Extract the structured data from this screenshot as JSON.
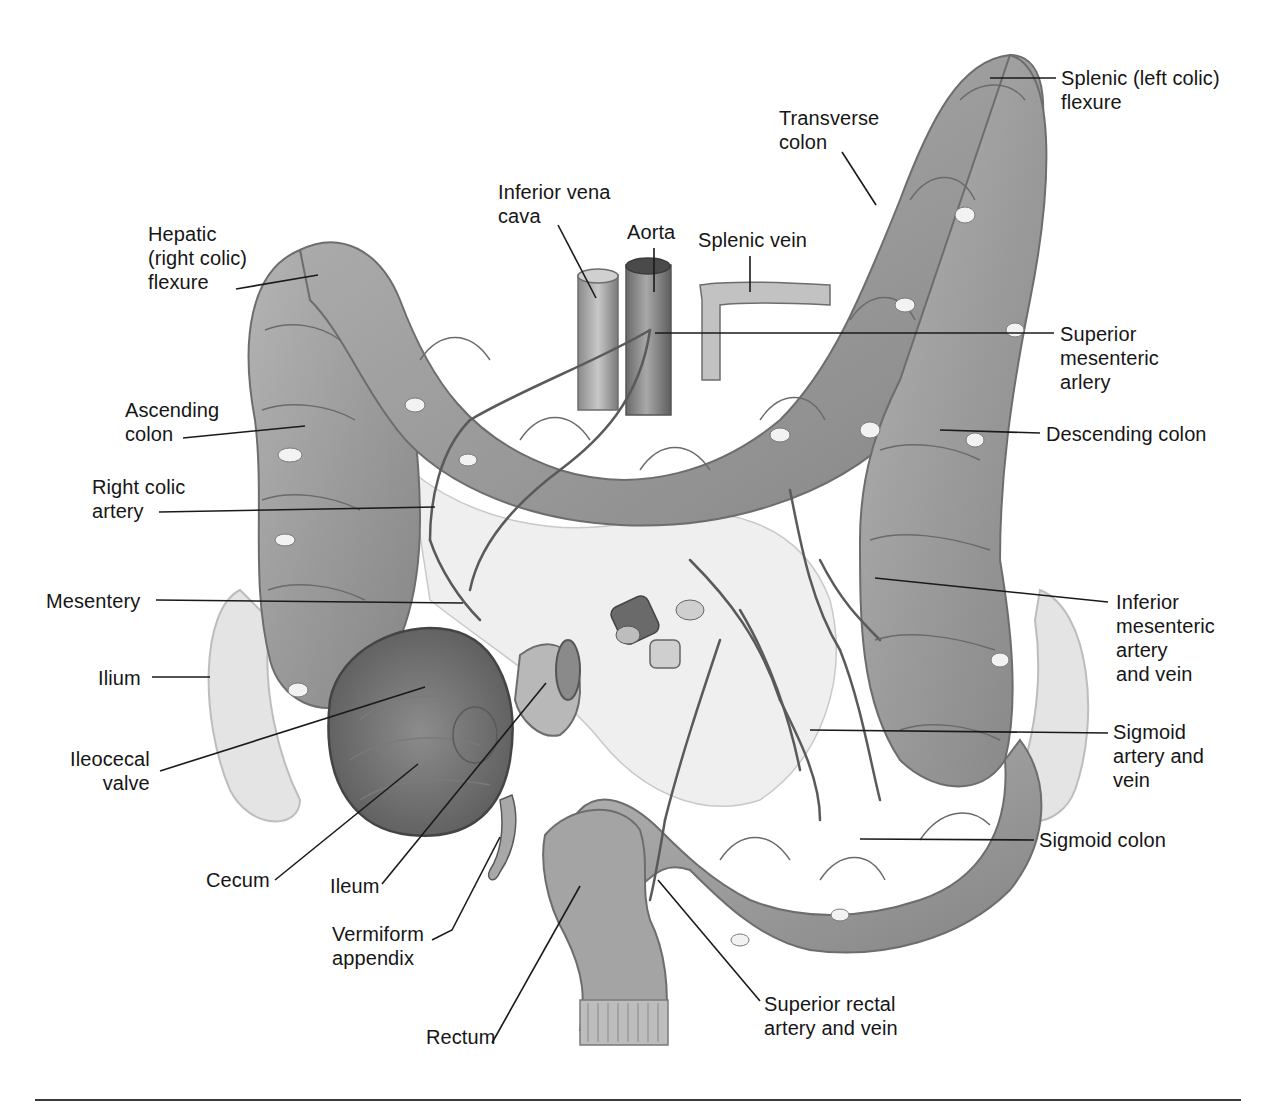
{
  "figure": {
    "colors": {
      "background": "#ffffff",
      "organ_fill": "#9a9a9a",
      "organ_light": "#c4c4c4",
      "organ_dark": "#6e6e6e",
      "vessel": "#5a5a5a",
      "leader_line": "#1a1a1a",
      "label_text": "#161616",
      "ilium_fill": "#e6e6e6"
    },
    "labels": [
      {
        "id": "splenic-flexure",
        "text": "Splenic (left colic)\nflexure",
        "x": 1061,
        "y": 66,
        "align": "left",
        "line": [
          [
            1056,
            78
          ],
          [
            990,
            78
          ]
        ]
      },
      {
        "id": "transverse-colon",
        "text": "Transverse\ncolon",
        "x": 779,
        "y": 106,
        "align": "left",
        "line": [
          [
            842,
            152
          ],
          [
            876,
            205
          ]
        ]
      },
      {
        "id": "inferior-vena-cava",
        "text": "Inferior vena\ncava",
        "x": 498,
        "y": 180,
        "align": "left",
        "line": [
          [
            558,
            225
          ],
          [
            596,
            298
          ]
        ]
      },
      {
        "id": "aorta",
        "text": "Aorta",
        "x": 627,
        "y": 220,
        "align": "left",
        "line": [
          [
            654,
            248
          ],
          [
            654,
            292
          ]
        ]
      },
      {
        "id": "splenic-vein",
        "text": "Splenic vein",
        "x": 698,
        "y": 228,
        "align": "left",
        "line": [
          [
            750,
            256
          ],
          [
            750,
            292
          ]
        ]
      },
      {
        "id": "hepatic-flexure",
        "text": "Hepatic\n(right colic)\nflexure",
        "x": 148,
        "y": 222,
        "align": "left",
        "line": [
          [
            236,
            289
          ],
          [
            318,
            275
          ]
        ]
      },
      {
        "id": "superior-mesenteric-artery",
        "text": "Superior\nmesenteric\narlery",
        "x": 1060,
        "y": 322,
        "align": "left",
        "line": [
          [
            1054,
            333
          ],
          [
            655,
            333
          ]
        ]
      },
      {
        "id": "ascending-colon",
        "text": "Ascending\ncolon",
        "x": 125,
        "y": 398,
        "align": "left",
        "line": [
          [
            183,
            438
          ],
          [
            305,
            426
          ]
        ]
      },
      {
        "id": "descending-colon",
        "text": "Descending colon",
        "x": 1046,
        "y": 422,
        "align": "left",
        "line": [
          [
            1040,
            433
          ],
          [
            940,
            430
          ]
        ]
      },
      {
        "id": "right-colic-artery",
        "text": "Right colic\nartery",
        "x": 92,
        "y": 475,
        "align": "left",
        "line": [
          [
            159,
            512
          ],
          [
            435,
            507
          ]
        ]
      },
      {
        "id": "mesentery",
        "text": "Mesentery",
        "x": 46,
        "y": 589,
        "align": "left",
        "line": [
          [
            156,
            600
          ],
          [
            463,
            603
          ]
        ]
      },
      {
        "id": "inferior-mesenteric",
        "text": "Inferior\nmesenteric\nartery\nand vein",
        "x": 1116,
        "y": 590,
        "align": "left",
        "line": [
          [
            1108,
            602
          ],
          [
            875,
            578
          ]
        ]
      },
      {
        "id": "ilium",
        "text": "Ilium",
        "x": 98,
        "y": 666,
        "align": "left",
        "line": [
          [
            152,
            677
          ],
          [
            210,
            677
          ]
        ]
      },
      {
        "id": "ileocecal-valve",
        "text": "Ileocecal\nvalve",
        "x": 70,
        "y": 747,
        "align": "right",
        "line": [
          [
            160,
            771
          ],
          [
            425,
            687
          ]
        ]
      },
      {
        "id": "sigmoid-artery-vein",
        "text": "Sigmoid\nartery and\nvein",
        "x": 1113,
        "y": 720,
        "align": "left",
        "line": [
          [
            1108,
            733
          ],
          [
            810,
            730
          ]
        ]
      },
      {
        "id": "sigmoid-colon",
        "text": "Sigmoid colon",
        "x": 1039,
        "y": 828,
        "align": "left",
        "line": [
          [
            1034,
            840
          ],
          [
            860,
            839
          ]
        ]
      },
      {
        "id": "cecum",
        "text": "Cecum",
        "x": 206,
        "y": 868,
        "align": "left",
        "line": [
          [
            275,
            880
          ],
          [
            418,
            764
          ]
        ]
      },
      {
        "id": "ileum",
        "text": "Ileum",
        "x": 330,
        "y": 874,
        "align": "left",
        "line": [
          [
            382,
            884
          ],
          [
            546,
            683
          ]
        ]
      },
      {
        "id": "vermiform-appendix",
        "text": "Vermiform\nappendix",
        "x": 332,
        "y": 922,
        "align": "left",
        "line": [
          [
            432,
            940
          ],
          [
            452,
            930
          ],
          [
            500,
            837
          ]
        ]
      },
      {
        "id": "rectum",
        "text": "Rectum",
        "x": 426,
        "y": 1025,
        "align": "left",
        "line": [
          [
            492,
            1043
          ],
          [
            580,
            886
          ]
        ]
      },
      {
        "id": "superior-rectal",
        "text": "Superior rectal\nartery and vein",
        "x": 764,
        "y": 992,
        "align": "left",
        "line": [
          [
            760,
            1001
          ],
          [
            658,
            880
          ]
        ]
      }
    ]
  }
}
